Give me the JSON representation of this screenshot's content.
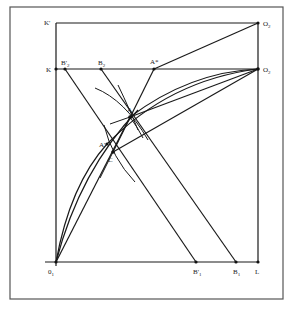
{
  "figure": {
    "type": "geometric construction diagram",
    "labels": {
      "K_prime": "K'",
      "K": "K",
      "O2_top": "O",
      "O2_top_sub": "2",
      "O2_mid": "O",
      "O2_mid_sub": "2",
      "B2_prime": "B'",
      "B2_prime_sub": "2",
      "B2": "B",
      "B2_sub": "2",
      "A_star": "A*",
      "A": "A",
      "A_prime": "A'",
      "C": "C",
      "O1": "0",
      "O1_sub": "1",
      "B1_prime": "B'",
      "B1_prime_sub": "1",
      "B1": "B",
      "B1_sub": "1",
      "L": "L"
    },
    "points": {
      "K_prime": [
        56,
        23
      ],
      "O2_top": [
        258,
        23
      ],
      "K": [
        56,
        69
      ],
      "O2_mid": [
        258,
        69
      ],
      "B2_prime": [
        65,
        69
      ],
      "B2": [
        101,
        69
      ],
      "A_star": [
        154,
        69
      ],
      "A": [
        130,
        117
      ],
      "A_prime": [
        107,
        144
      ],
      "C": [
        113,
        152
      ],
      "O1": [
        56,
        262
      ],
      "B1_prime": [
        196,
        262
      ],
      "B1": [
        236,
        262
      ],
      "L": [
        258,
        262
      ]
    },
    "colors": {
      "line": "#1a1a1a",
      "frame": "#555555",
      "background": "#ffffff"
    }
  }
}
